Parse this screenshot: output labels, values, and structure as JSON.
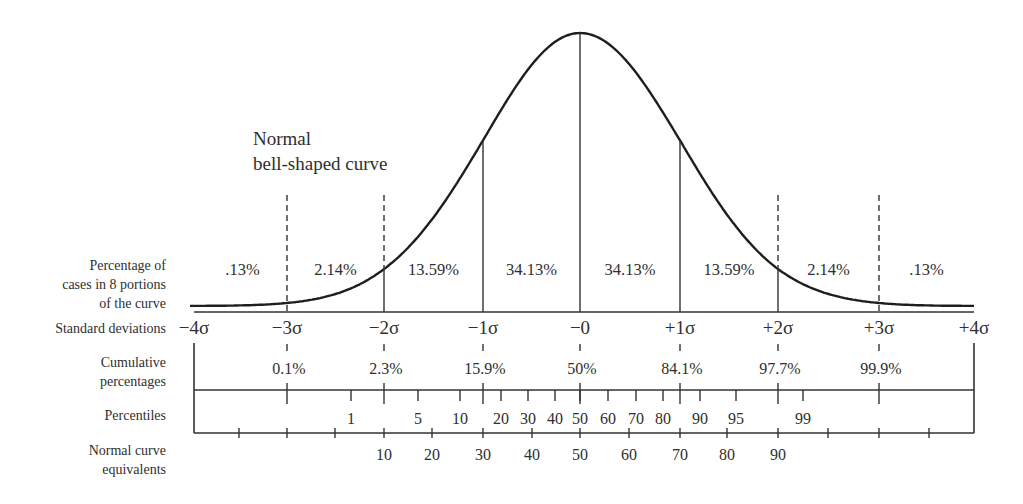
{
  "chart_data": {
    "type": "line",
    "title": "Normal bell-shaped curve",
    "curve_label": [
      "Normal",
      "bell-shaped curve"
    ],
    "x_sigma_range": [
      -4,
      4
    ],
    "standard_deviations": [
      "−4σ",
      "−3σ",
      "−2σ",
      "−1σ",
      "−0",
      "+1σ",
      "+2σ",
      "+3σ",
      "+4σ"
    ],
    "portions": {
      "label": [
        "Percentage of",
        "cases in 8 portions",
        "of the curve"
      ],
      "values": [
        ".13%",
        "2.14%",
        "13.59%",
        "34.13%",
        "34.13%",
        "13.59%",
        "2.14%",
        ".13%"
      ]
    },
    "cumulative_percentages": {
      "label": [
        "Cumulative",
        "percentages"
      ],
      "at_sigma": [
        -3,
        -2,
        -1,
        0,
        1,
        2,
        3
      ],
      "values": [
        "0.1%",
        "2.3%",
        "15.9%",
        "50%",
        "84.1%",
        "97.7%",
        "99.9%"
      ]
    },
    "percentiles": {
      "label": [
        "Percentiles"
      ],
      "values": [
        "1",
        "5",
        "10",
        "20",
        "30",
        "40",
        "50",
        "60",
        "70",
        "80",
        "90",
        "95",
        "99"
      ]
    },
    "normal_curve_equivalents": {
      "label": [
        "Normal curve",
        "equivalents"
      ],
      "values": [
        "10",
        "20",
        "30",
        "40",
        "50",
        "60",
        "70",
        "80",
        "90"
      ]
    },
    "grid": false,
    "legend": "none"
  },
  "labels": {
    "curve_line1": "Normal",
    "curve_line2": "bell-shaped curve",
    "row_portions_1": "Percentage of",
    "row_portions_2": "cases in 8 portions",
    "row_portions_3": "of the curve",
    "row_sd": "Standard deviations",
    "row_cum_1": "Cumulative",
    "row_cum_2": "percentages",
    "row_pct": "Percentiles",
    "row_nce_1": "Normal curve",
    "row_nce_2": "equivalents"
  },
  "colors": {
    "ink": "#2a2a2a",
    "background": "#ffffff"
  }
}
